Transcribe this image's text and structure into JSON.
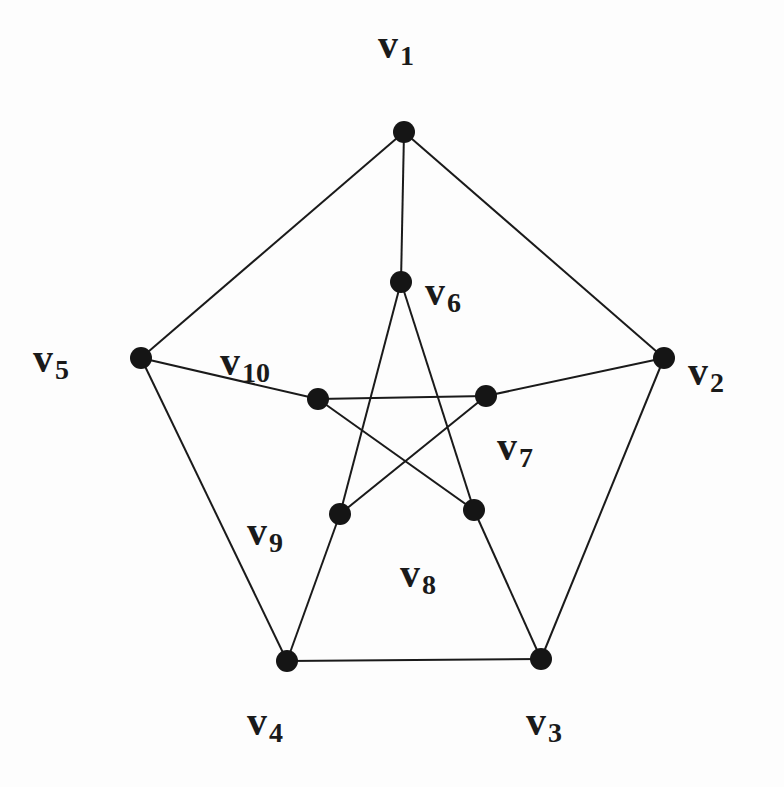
{
  "diagram": {
    "vertices": [
      {
        "id": "v1",
        "name": "v",
        "sub": "1",
        "x": 404,
        "y": 132,
        "lx": 378,
        "ly": 58
      },
      {
        "id": "v2",
        "name": "v",
        "sub": "2",
        "x": 664,
        "y": 358,
        "lx": 688,
        "ly": 385
      },
      {
        "id": "v3",
        "name": "v",
        "sub": "3",
        "x": 541,
        "y": 659,
        "lx": 526,
        "ly": 735
      },
      {
        "id": "v4",
        "name": "v",
        "sub": "4",
        "x": 287,
        "y": 661,
        "lx": 247,
        "ly": 735
      },
      {
        "id": "v5",
        "name": "v",
        "sub": "5",
        "x": 141,
        "y": 358,
        "lx": 33,
        "ly": 372
      },
      {
        "id": "v6",
        "name": "v",
        "sub": "6",
        "x": 401,
        "y": 282,
        "lx": 425,
        "ly": 305
      },
      {
        "id": "v7",
        "name": "v",
        "sub": "7",
        "x": 486,
        "y": 396,
        "lx": 497,
        "ly": 460
      },
      {
        "id": "v8",
        "name": "v",
        "sub": "8",
        "x": 474,
        "y": 510,
        "lx": 400,
        "ly": 587
      },
      {
        "id": "v9",
        "name": "v",
        "sub": "9",
        "x": 340,
        "y": 514,
        "lx": 247,
        "ly": 545
      },
      {
        "id": "v10",
        "name": "v",
        "sub": "10",
        "x": 318,
        "y": 399,
        "lx": 220,
        "ly": 375
      }
    ],
    "edges": [
      [
        "v1",
        "v2"
      ],
      [
        "v2",
        "v3"
      ],
      [
        "v3",
        "v4"
      ],
      [
        "v4",
        "v5"
      ],
      [
        "v5",
        "v1"
      ],
      [
        "v1",
        "v6"
      ],
      [
        "v2",
        "v7"
      ],
      [
        "v3",
        "v8"
      ],
      [
        "v4",
        "v9"
      ],
      [
        "v5",
        "v10"
      ],
      [
        "v6",
        "v8"
      ],
      [
        "v8",
        "v10"
      ],
      [
        "v10",
        "v7"
      ],
      [
        "v7",
        "v9"
      ],
      [
        "v9",
        "v6"
      ]
    ]
  }
}
